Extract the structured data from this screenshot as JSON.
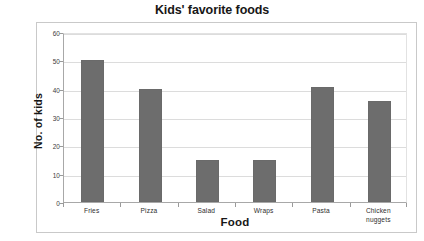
{
  "chart_data": {
    "type": "bar",
    "title": "Kids' favorite foods",
    "xlabel": "Food",
    "ylabel": "No. of kids",
    "categories": [
      "Fries",
      "Pizza",
      "Salad",
      "Wraps",
      "Pasta",
      "Chicken nuggets"
    ],
    "values": [
      50,
      40,
      15,
      15,
      40.5,
      35.5
    ],
    "ylim": [
      0,
      60
    ],
    "yticks": [
      0,
      10,
      20,
      30,
      40,
      50,
      60
    ],
    "ytick_labels": [
      "0",
      "10",
      "20",
      "30",
      "40",
      "50",
      "60"
    ],
    "grid": true,
    "legend": false,
    "bar_color": "#6d6d6d",
    "gridline_color": "#dcdcdc",
    "axis_color": "#a8a8a8",
    "frame_color": "#c9c9c9",
    "background": "#ffffff"
  }
}
